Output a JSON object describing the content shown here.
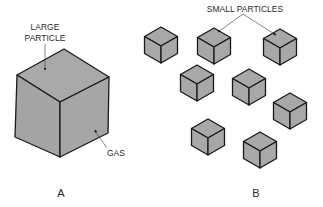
{
  "diagram": {
    "panel_a": {
      "label": "A",
      "particle_label_line1": "LARGE",
      "particle_label_line2": "PARTICLE",
      "gas_label": "GAS"
    },
    "panel_b": {
      "label": "B",
      "particles_label": "SMALL PARTICLES",
      "cube_count": 8
    },
    "colors": {
      "cube_fill": "#a8a8a8",
      "outline": "#1a1a1a",
      "background": "#ffffff"
    }
  }
}
